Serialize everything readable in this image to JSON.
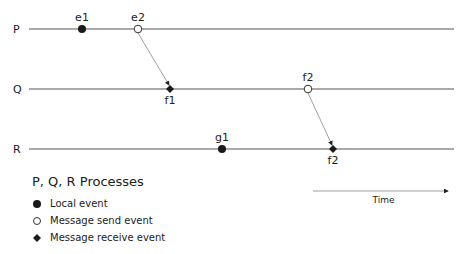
{
  "diagram": {
    "type": "space-time diagram",
    "processes": [
      {
        "label": "P",
        "y": 29
      },
      {
        "label": "Q",
        "y": 89
      },
      {
        "label": "R",
        "y": 149
      }
    ],
    "line_x_start": 29,
    "line_x_end": 454,
    "events": [
      {
        "label": "e1",
        "process": "P",
        "x": 82,
        "kind": "local"
      },
      {
        "label": "e2",
        "process": "P",
        "x": 138,
        "kind": "send"
      },
      {
        "label": "f1",
        "process": "Q",
        "x": 170,
        "kind": "receive"
      },
      {
        "label": "f2",
        "process": "Q",
        "x": 308,
        "kind": "send"
      },
      {
        "label": "g1",
        "process": "R",
        "x": 222,
        "kind": "local"
      },
      {
        "label": "f2",
        "process": "R",
        "x": 333,
        "kind": "receive"
      }
    ],
    "messages": [
      {
        "from": {
          "x": 138,
          "y": 29
        },
        "to": {
          "x": 170,
          "y": 89
        }
      },
      {
        "from": {
          "x": 308,
          "y": 89
        },
        "to": {
          "x": 333,
          "y": 149
        }
      }
    ],
    "time_axis": {
      "label": "Time",
      "x1": 313,
      "x2": 448,
      "y": 191
    }
  },
  "legend": {
    "title": "P, Q, R  Processes",
    "items": [
      {
        "symbol": "filled-circle",
        "label": "Local event"
      },
      {
        "symbol": "open-circle",
        "label": "Message send event"
      },
      {
        "symbol": "diamond",
        "label": "Message receive event"
      }
    ]
  },
  "colors": {
    "line": "#555555",
    "message": "#888888",
    "marker": "#1a1a1a",
    "text": "#222222"
  }
}
